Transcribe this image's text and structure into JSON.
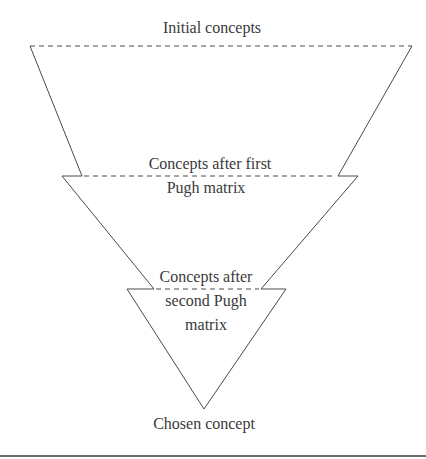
{
  "diagram": {
    "type": "funnel",
    "stages": [
      {
        "label": "Initial concepts"
      },
      {
        "label_line1": "Concepts after first",
        "label_line2": "Pugh matrix"
      },
      {
        "label_line1": "Concepts after",
        "label_line2": "second Pugh",
        "label_line3": "matrix"
      },
      {
        "label": "Chosen concept"
      }
    ],
    "colors": {
      "line": "#4a4a4a",
      "text": "#3a3a3a",
      "background": "#ffffff"
    }
  }
}
